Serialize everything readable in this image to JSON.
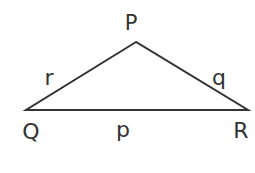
{
  "diagram": {
    "type": "triangle",
    "stroke_color": "#333333",
    "vertices": [
      {
        "name": "P",
        "x": 136,
        "y": 42
      },
      {
        "name": "Q",
        "x": 26,
        "y": 110
      },
      {
        "name": "R",
        "x": 248,
        "y": 110
      }
    ],
    "vertex_labels": {
      "P": "P",
      "Q": "Q",
      "R": "R"
    },
    "side_labels": {
      "PQ": "r",
      "PR": "q",
      "QR": "p"
    }
  }
}
